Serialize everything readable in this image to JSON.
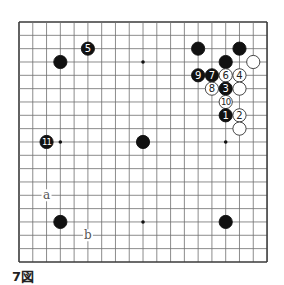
{
  "diagram": {
    "caption": "7図",
    "board": {
      "size": 19,
      "origin": {
        "x": 19,
        "y": 22
      },
      "spacing": {
        "x": 13.78,
        "y": 13.33
      },
      "line_color": "#6f6f6f",
      "border_color": "#3a3a3a",
      "star_points": [
        [
          3,
          3
        ],
        [
          9,
          3
        ],
        [
          15,
          3
        ],
        [
          3,
          9
        ],
        [
          9,
          9
        ],
        [
          15,
          9
        ],
        [
          3,
          15
        ],
        [
          9,
          15
        ],
        [
          15,
          15
        ]
      ]
    },
    "stones": [
      {
        "color": "black",
        "col": 3,
        "row": 3,
        "label": ""
      },
      {
        "color": "black",
        "col": 5,
        "row": 2,
        "label": "5"
      },
      {
        "color": "black",
        "col": 13,
        "row": 2,
        "label": ""
      },
      {
        "color": "black",
        "col": 16,
        "row": 2,
        "label": ""
      },
      {
        "color": "black",
        "col": 15,
        "row": 3,
        "label": ""
      },
      {
        "color": "white",
        "col": 17,
        "row": 3,
        "label": ""
      },
      {
        "color": "black",
        "col": 13,
        "row": 4,
        "label": "9"
      },
      {
        "color": "black",
        "col": 14,
        "row": 4,
        "label": "7"
      },
      {
        "color": "white",
        "col": 15,
        "row": 4,
        "label": "6"
      },
      {
        "color": "white",
        "col": 16,
        "row": 4,
        "label": "4"
      },
      {
        "color": "white",
        "col": 14,
        "row": 5,
        "label": "8"
      },
      {
        "color": "black",
        "col": 15,
        "row": 5,
        "label": "3"
      },
      {
        "color": "white",
        "col": 16,
        "row": 5,
        "label": ""
      },
      {
        "color": "white",
        "col": 15,
        "row": 6,
        "label": "10"
      },
      {
        "color": "black",
        "col": 15,
        "row": 7,
        "label": "1"
      },
      {
        "color": "white",
        "col": 16,
        "row": 7,
        "label": "2"
      },
      {
        "color": "white",
        "col": 16,
        "row": 8,
        "label": ""
      },
      {
        "color": "black",
        "col": 2,
        "row": 9,
        "label": "11"
      },
      {
        "color": "black",
        "col": 9,
        "row": 9,
        "label": ""
      },
      {
        "color": "black",
        "col": 3,
        "row": 15,
        "label": ""
      },
      {
        "color": "black",
        "col": 15,
        "row": 15,
        "label": ""
      }
    ],
    "markers": [
      {
        "col": 2,
        "row": 13,
        "label": "a"
      },
      {
        "col": 5,
        "row": 16,
        "label": "b"
      }
    ]
  }
}
